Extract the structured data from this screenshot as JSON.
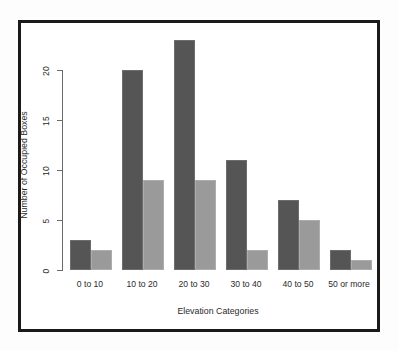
{
  "chart_data": {
    "type": "bar",
    "title": "",
    "subtitle": "",
    "xlabel": "Elevation Categories",
    "ylabel": "Number of Occupied Boxes",
    "categories": [
      "0 to 10",
      "10 to 20",
      "20 to 30",
      "30 to 40",
      "40 to 50",
      "50 or more"
    ],
    "series": [
      {
        "name": "series-1-dark",
        "color": "#555555",
        "values": [
          3,
          20,
          23,
          11,
          7,
          2
        ]
      },
      {
        "name": "series-2-light",
        "color": "#9a9a9a",
        "values": [
          2,
          9,
          9,
          2,
          5,
          1
        ]
      }
    ],
    "yticks": [
      0,
      5,
      10,
      15,
      20
    ],
    "ytick_labels": [
      "0",
      "5",
      "10",
      "15",
      "20"
    ],
    "ylim": [
      0,
      20
    ],
    "grid": false,
    "legend": "none",
    "bar_orientation": "vertical",
    "grouping": "grouped",
    "axis_line_color": "#6b6b6b",
    "frame_border_color": "#1a1a1a",
    "plot_background": "#ffffff"
  },
  "figure": {
    "y_tick_label_rotation": "-90",
    "x_tick_label_rotation": "0",
    "border_present": "true"
  }
}
